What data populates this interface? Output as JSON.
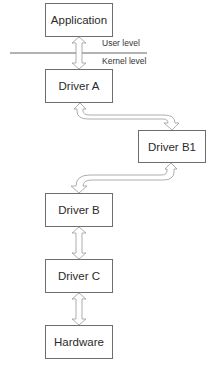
{
  "diagram": {
    "boundary": {
      "upper_label": "User level",
      "lower_label": "Kernel level"
    },
    "nodes": [
      {
        "id": "application",
        "label": "Application"
      },
      {
        "id": "driver_a",
        "label": "Driver A"
      },
      {
        "id": "driver_b1",
        "label": "Driver B1"
      },
      {
        "id": "driver_b",
        "label": "Driver B"
      },
      {
        "id": "driver_c",
        "label": "Driver C"
      },
      {
        "id": "hardware",
        "label": "Hardware"
      }
    ],
    "edges": [
      {
        "from": "application",
        "to": "driver_a",
        "type": "bidirectional"
      },
      {
        "from": "driver_a",
        "to": "driver_b1",
        "type": "bidirectional"
      },
      {
        "from": "driver_b1",
        "to": "driver_b",
        "type": "bidirectional"
      },
      {
        "from": "driver_b",
        "to": "driver_c",
        "type": "bidirectional"
      },
      {
        "from": "driver_c",
        "to": "hardware",
        "type": "bidirectional"
      }
    ],
    "colors": {
      "box_border": "#6e6e6e",
      "arrow_stroke": "#9a9a9a",
      "line": "#555555"
    }
  }
}
